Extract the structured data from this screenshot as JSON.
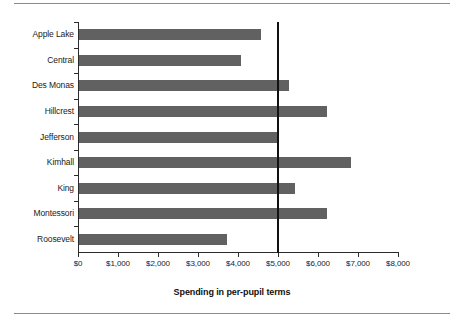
{
  "chart_data": {
    "type": "bar",
    "orientation": "horizontal",
    "title": "",
    "xlabel": "Spending in per-pupil terms",
    "ylabel": "",
    "categories": [
      "Apple Lake",
      "Central",
      "Des Monas",
      "Hillcrest",
      "Jefferson",
      "Kimhall",
      "King",
      "Montessori",
      "Roosevelt"
    ],
    "values": [
      4550,
      4050,
      5250,
      6200,
      5000,
      6800,
      5400,
      6200,
      3700
    ],
    "xlim": [
      0,
      8000
    ],
    "xticks": [
      0,
      1000,
      2000,
      3000,
      4000,
      5000,
      6000,
      7000,
      8000
    ],
    "xtick_labels": [
      "$0",
      "$1,000",
      "$2,000",
      "$3,000",
      "$4,000",
      "$5,000",
      "$6,000",
      "$7,000",
      "$8,000"
    ],
    "grid": false,
    "legend": false,
    "reference_line": {
      "value": 5000,
      "orientation": "vertical",
      "color": "#111111"
    },
    "bar_color": "#616161",
    "axis_color": "#2b2b2b"
  }
}
